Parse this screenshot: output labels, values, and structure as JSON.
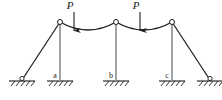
{
  "figure": {
    "type": "structural-diagram",
    "width": 222,
    "height": 100,
    "background_color": "#ffffff",
    "line_color": "#1a1a1a"
  },
  "loads": [
    {
      "id": "load-1",
      "label": "P",
      "x": 74,
      "tip_y": 31,
      "tail_y": 12,
      "label_x": 71,
      "label_y": 10
    },
    {
      "id": "load-2",
      "label": "P",
      "x": 140,
      "tip_y": 31,
      "tail_y": 12,
      "label_x": 137,
      "label_y": 10
    }
  ],
  "hinges": [
    {
      "id": "hinge-left",
      "x": 60,
      "y": 22
    },
    {
      "id": "hinge-mid",
      "x": 116,
      "y": 22
    },
    {
      "id": "hinge-right",
      "x": 172,
      "y": 22
    }
  ],
  "arches": [
    {
      "id": "arch-left",
      "from_x": 60,
      "from_y": 22,
      "to_x": 116,
      "to_y": 22,
      "sag_y": 32
    },
    {
      "id": "arch-right",
      "from_x": 116,
      "from_y": 22,
      "to_x": 172,
      "to_y": 22,
      "sag_y": 32
    }
  ],
  "columns": [
    {
      "id": "column-a",
      "top_x": 60,
      "top_y": 22,
      "base_x": 60,
      "base_y": 80
    },
    {
      "id": "column-b",
      "top_x": 116,
      "top_y": 22,
      "base_x": 116,
      "base_y": 80
    },
    {
      "id": "column-c",
      "top_x": 172,
      "top_y": 22,
      "base_x": 172,
      "base_y": 80
    }
  ],
  "braces": [
    {
      "id": "brace-left",
      "top_x": 60,
      "top_y": 22,
      "base_x": 22,
      "base_y": 80
    },
    {
      "id": "brace-right",
      "top_x": 172,
      "top_y": 22,
      "base_x": 210,
      "base_y": 80
    }
  ],
  "supports": [
    {
      "id": "support-left-outer",
      "x": 22,
      "y": 80,
      "label": "",
      "pin": true
    },
    {
      "id": "support-a",
      "x": 60,
      "y": 80,
      "label": "a",
      "label_x": 55,
      "label_y": 77,
      "pin": false
    },
    {
      "id": "support-b",
      "x": 116,
      "y": 80,
      "label": "b",
      "label_x": 111,
      "label_y": 77,
      "pin": false
    },
    {
      "id": "support-c",
      "x": 172,
      "y": 80,
      "label": "c",
      "label_x": 167,
      "label_y": 77,
      "pin": false
    },
    {
      "id": "support-right-outer",
      "x": 210,
      "y": 80,
      "label": "",
      "pin": true
    }
  ],
  "support_labels": {
    "a": "a",
    "b": "b",
    "c": "c"
  }
}
